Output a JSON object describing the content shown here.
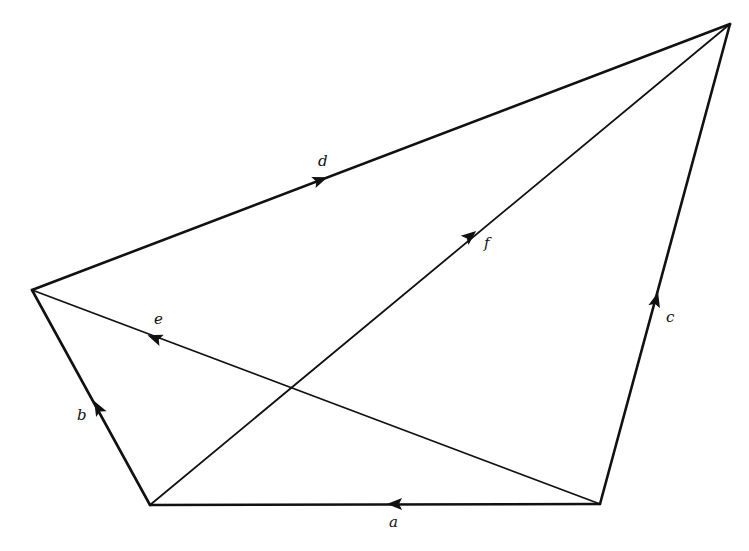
{
  "diagram": {
    "type": "vector-graph",
    "vertices": {
      "A": [
        150,
        505
      ],
      "B": [
        600,
        504
      ],
      "C": [
        730,
        24
      ],
      "D": [
        32,
        290
      ]
    },
    "edges": [
      {
        "label": "a",
        "from": "B",
        "to": "A",
        "arrow": [
          395,
          504
        ],
        "label_pos": [
          389,
          527
        ]
      },
      {
        "label": "b",
        "from": "A",
        "to": "D",
        "arrow": [
          98,
          408
        ],
        "label_pos": [
          77,
          420
        ]
      },
      {
        "label": "c",
        "from": "B",
        "to": "C",
        "arrow": [
          656,
          300
        ],
        "label_pos": [
          666,
          322
        ]
      },
      {
        "label": "d",
        "from": "D",
        "to": "C",
        "arrow": [
          320,
          180
        ],
        "label_pos": [
          318,
          166
        ]
      },
      {
        "label": "e",
        "from": "B",
        "to": "D",
        "arrow": [
          155,
          338
        ],
        "label_pos": [
          154,
          324
        ]
      },
      {
        "label": "f",
        "from": "A",
        "to": "C",
        "arrow": [
          470,
          236
        ],
        "label_pos": [
          484,
          248
        ]
      }
    ]
  }
}
